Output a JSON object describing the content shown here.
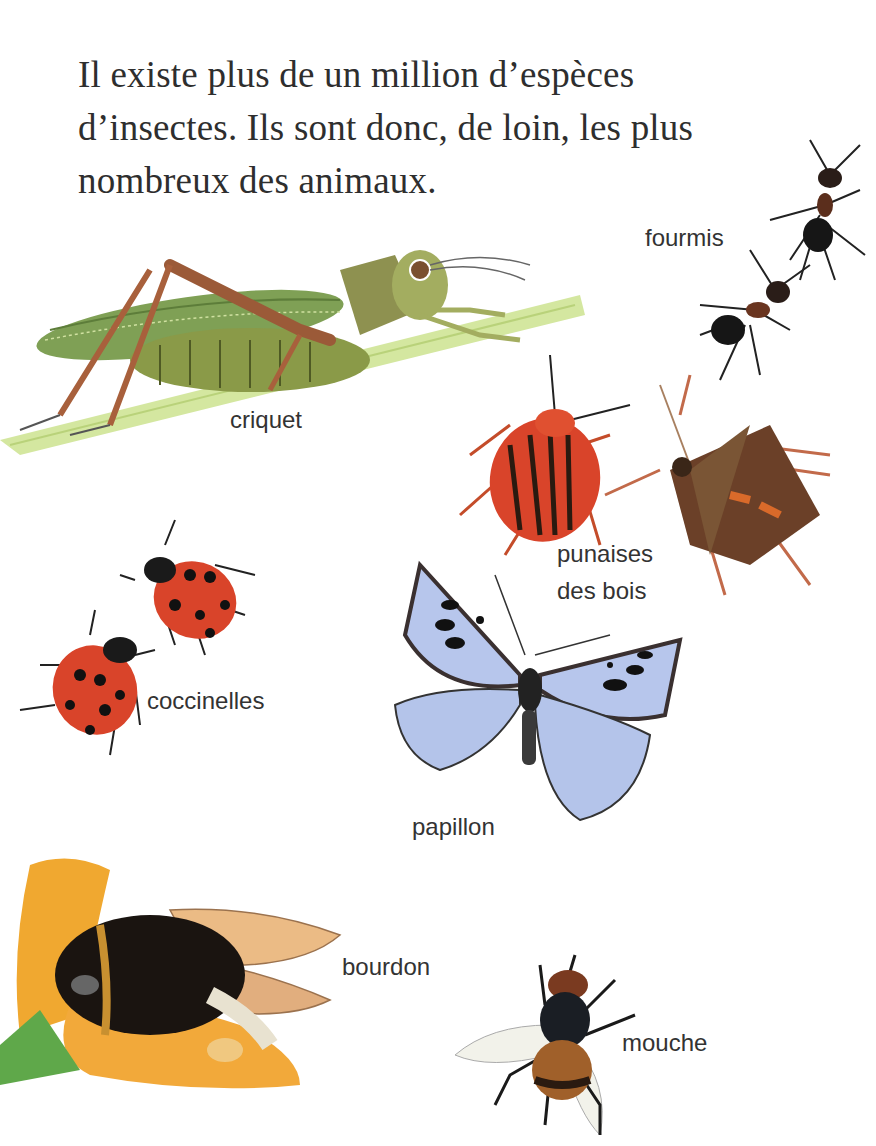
{
  "intro": {
    "lines": [
      "Il existe plus de un million d’espèces",
      "d’insectes. Ils sont donc, de loin, les plus",
      "nombreux des animaux."
    ]
  },
  "labels": {
    "criquet": "criquet",
    "fourmis": "fourmis",
    "punaises_line1": "punaises",
    "punaises_line2": "des bois",
    "coccinelles": "coccinelles",
    "papillon": "papillon",
    "bourdon": "bourdon",
    "mouche": "mouche"
  },
  "illustrations": [
    {
      "name": "criquet",
      "icon": "grasshopper-illustration"
    },
    {
      "name": "fourmis",
      "icon": "ants-illustration"
    },
    {
      "name": "punaises des bois",
      "icon": "shield-bugs-illustration"
    },
    {
      "name": "coccinelles",
      "icon": "ladybirds-illustration"
    },
    {
      "name": "papillon",
      "icon": "butterfly-illustration"
    },
    {
      "name": "bourdon",
      "icon": "bumblebee-illustration"
    },
    {
      "name": "mouche",
      "icon": "fly-illustration"
    }
  ],
  "colors": {
    "text": "#2e2e2e",
    "grass": "#cfe39a",
    "grasshopper_green": "#7a9a4a",
    "ladybird_red": "#d9442a",
    "butterfly_blue": "#b7c6ec",
    "flower_orange": "#f0a830"
  }
}
